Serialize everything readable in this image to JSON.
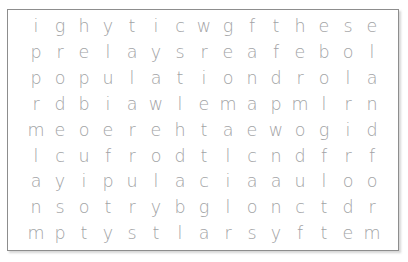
{
  "puzzle": {
    "type": "word-search-grid",
    "rows": 9,
    "columns": 15,
    "letter_case": "lowercase",
    "colors": {
      "letter": "#a2a3a5",
      "border": "#8d8d8d",
      "background": "#ffffff"
    },
    "grid": [
      [
        "i",
        "g",
        "h",
        "y",
        "t",
        "i",
        "c",
        "w",
        "g",
        "f",
        "t",
        "h",
        "e",
        "s",
        "e"
      ],
      [
        "p",
        "r",
        "e",
        "l",
        "a",
        "y",
        "s",
        "r",
        "e",
        "a",
        "f",
        "e",
        "b",
        "o",
        "l"
      ],
      [
        "p",
        "o",
        "p",
        "u",
        "l",
        "a",
        "t",
        "i",
        "o",
        "n",
        "d",
        "r",
        "o",
        "l",
        "a"
      ],
      [
        "r",
        "d",
        "b",
        "i",
        "a",
        "w",
        "l",
        "e",
        "m",
        "a",
        "p",
        "m",
        "l",
        "r",
        "n"
      ],
      [
        "m",
        "e",
        "o",
        "e",
        "r",
        "e",
        "h",
        "t",
        "a",
        "e",
        "w",
        "o",
        "g",
        "i",
        "d"
      ],
      [
        "l",
        "c",
        "u",
        "f",
        "r",
        "o",
        "d",
        "t",
        "l",
        "c",
        "n",
        "d",
        "f",
        "r",
        "f"
      ],
      [
        "a",
        "y",
        "i",
        "p",
        "u",
        "l",
        "a",
        "c",
        "i",
        "a",
        "a",
        "u",
        "l",
        "o",
        "o"
      ],
      [
        "n",
        "s",
        "o",
        "t",
        "r",
        "y",
        "b",
        "g",
        "l",
        "o",
        "n",
        "c",
        "t",
        "d",
        "r"
      ],
      [
        "m",
        "p",
        "t",
        "y",
        "s",
        "t",
        "l",
        "a",
        "r",
        "s",
        "y",
        "f",
        "t",
        "e",
        "m"
      ]
    ]
  }
}
